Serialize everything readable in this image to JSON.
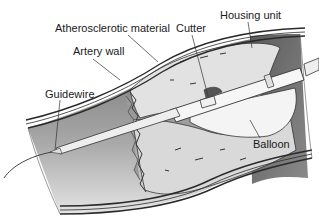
{
  "diagram": {
    "labels": {
      "atherosclerotic_material": "Atherosclerotic material",
      "artery_wall": "Artery wall",
      "guidewire": "Guidewire",
      "cutter": "Cutter",
      "housing_unit": "Housing unit",
      "balloon": "Balloon"
    },
    "colors": {
      "lumen_dark": "#7a7a7a",
      "lumen_light": "#d6d6d6",
      "plaque": "#e6e6e6",
      "wall_stroke": "#2a2a2a",
      "catheter": "#f2f2f2"
    }
  }
}
